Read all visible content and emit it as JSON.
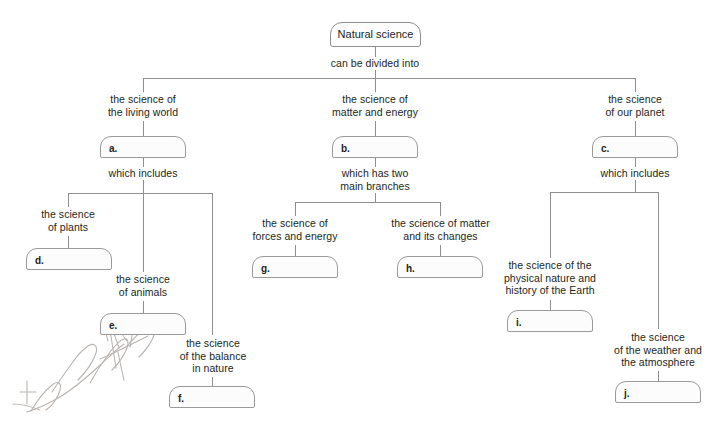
{
  "diagram": {
    "type": "concept-map",
    "title": "Natural science",
    "root": {
      "label": "Natural science",
      "connector": "can be divided into"
    },
    "branches": [
      {
        "prompt": "the science of\nthe living world",
        "answer_letter": "a.",
        "connector": "which includes",
        "children": [
          {
            "prompt": "the science\nof plants",
            "answer_letter": "d."
          },
          {
            "prompt": "the science\nof animals",
            "answer_letter": "e."
          },
          {
            "prompt": "the science\nof the balance\nin nature",
            "answer_letter": "f."
          }
        ]
      },
      {
        "prompt": "the science of\nmatter and energy",
        "answer_letter": "b.",
        "connector": "which has two\nmain branches",
        "children": [
          {
            "prompt": "the science of\nforces and energy",
            "answer_letter": "g."
          },
          {
            "prompt": "the science of matter\nand its changes",
            "answer_letter": "h."
          }
        ]
      },
      {
        "prompt": "the science\nof our planet",
        "answer_letter": "c.",
        "connector": "which includes",
        "children": [
          {
            "prompt": "the science of the\nphysical nature and\nhistory of the Earth",
            "answer_letter": "i."
          },
          {
            "prompt": "the science\nof the weather and\nthe atmosphere",
            "answer_letter": "j."
          }
        ]
      }
    ],
    "annotation": {
      "handwriting": "Love",
      "description": "faint handwritten pencil scribble over the lower-left area"
    },
    "colors": {
      "text": "#231f20",
      "line": "#8e8e8e",
      "box_fill": "#fcfcfc",
      "box_border": "#9a9a9a",
      "background": "#ffffff",
      "handwriting": "#b9b4b0"
    }
  }
}
